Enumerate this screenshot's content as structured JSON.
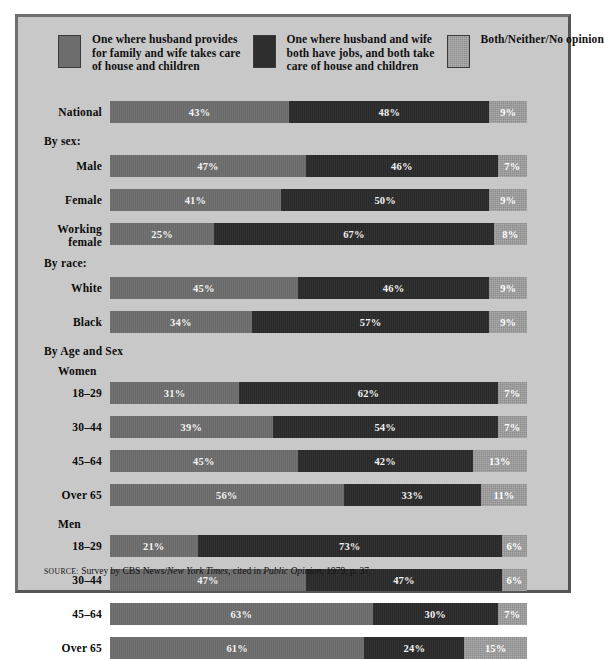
{
  "legend": [
    {
      "swatch": "swatch-dark-gray",
      "color": "#6d6d6d",
      "lines": [
        "One where husband provides",
        "for family and wife takes care",
        "of house and children"
      ]
    },
    {
      "swatch": "swatch-black",
      "color": "#2b2b2b",
      "lines": [
        "One where husband and wife",
        "both have jobs, and both take",
        "care of house and children"
      ]
    },
    {
      "swatch": "swatch-light-gray",
      "color": "#9b9b9b",
      "lines": [
        "Both/Neither/No opinion"
      ]
    }
  ],
  "source": {
    "prefix": "Source:",
    "text_1": "Survey by CBS News/",
    "italic_1": "New York Times",
    "text_2": ", cited in ",
    "italic_2": "Public Opinion",
    "text_3": ", 1979, p. 37."
  },
  "chart_data": {
    "type": "bar",
    "orientation": "horizontal",
    "stacked": true,
    "title": "",
    "xlabel": "",
    "ylabel": "",
    "xlim": [
      0,
      100
    ],
    "grid": false,
    "legend_position": "top",
    "value_unit": "%",
    "series": [
      {
        "name": "One where husband provides for family and wife takes care of house and children",
        "color": "#6d6d6d",
        "values": [
          43,
          47,
          41,
          25,
          45,
          34,
          31,
          39,
          45,
          56,
          21,
          47,
          63,
          61
        ]
      },
      {
        "name": "One where husband and wife both have jobs, and both take care of house and children",
        "color": "#2b2b2b",
        "values": [
          48,
          46,
          50,
          67,
          46,
          57,
          62,
          54,
          42,
          33,
          73,
          47,
          30,
          24
        ]
      },
      {
        "name": "Both/Neither/No opinion",
        "color": "#9b9b9b",
        "values": [
          9,
          7,
          9,
          8,
          9,
          9,
          7,
          7,
          13,
          11,
          6,
          6,
          7,
          15
        ]
      }
    ],
    "categories": [
      "National",
      "Male",
      "Female",
      "Working female",
      "White",
      "Black",
      "18-29",
      "30-44",
      "45-64",
      "Over 65",
      "18-29",
      "30-44",
      "45-64",
      "Over 65"
    ]
  },
  "blocks": [
    {
      "type": "row",
      "label_lines": [
        "National"
      ],
      "values": [
        43,
        48,
        9
      ],
      "labels": [
        "43%",
        "48%",
        "9%"
      ]
    },
    {
      "type": "group",
      "label": "By sex:"
    },
    {
      "type": "row",
      "label_lines": [
        "Male"
      ],
      "values": [
        47,
        46,
        7
      ],
      "labels": [
        "47%",
        "46%",
        "7%"
      ]
    },
    {
      "type": "row",
      "label_lines": [
        "Female"
      ],
      "values": [
        41,
        50,
        9
      ],
      "labels": [
        "41%",
        "50%",
        "9%"
      ]
    },
    {
      "type": "row",
      "label_lines": [
        "Working",
        "female"
      ],
      "values": [
        25,
        67,
        8
      ],
      "labels": [
        "25%",
        "67%",
        "8%"
      ]
    },
    {
      "type": "group",
      "label": "By race:"
    },
    {
      "type": "row",
      "label_lines": [
        "White"
      ],
      "values": [
        45,
        46,
        9
      ],
      "labels": [
        "45%",
        "46%",
        "9%"
      ]
    },
    {
      "type": "row",
      "label_lines": [
        "Black"
      ],
      "values": [
        34,
        57,
        9
      ],
      "labels": [
        "34%",
        "57%",
        "9%"
      ]
    },
    {
      "type": "group",
      "label": "By Age and Sex"
    },
    {
      "type": "subgroup",
      "label": "Women"
    },
    {
      "type": "row",
      "label_lines": [
        "18–29"
      ],
      "values": [
        31,
        62,
        7
      ],
      "labels": [
        "31%",
        "62%",
        "7%"
      ]
    },
    {
      "type": "row",
      "label_lines": [
        "30–44"
      ],
      "values": [
        39,
        54,
        7
      ],
      "labels": [
        "39%",
        "54%",
        "7%"
      ]
    },
    {
      "type": "row",
      "label_lines": [
        "45–64"
      ],
      "values": [
        45,
        42,
        13
      ],
      "labels": [
        "45%",
        "42%",
        "13%"
      ]
    },
    {
      "type": "row",
      "label_lines": [
        "Over 65"
      ],
      "values": [
        56,
        33,
        11
      ],
      "labels": [
        "56%",
        "33%",
        "11%"
      ]
    },
    {
      "type": "subgroup",
      "label": "Men"
    },
    {
      "type": "row",
      "label_lines": [
        "18–29"
      ],
      "values": [
        21,
        73,
        6
      ],
      "labels": [
        "21%",
        "73%",
        "6%"
      ]
    },
    {
      "type": "row",
      "label_lines": [
        "30–44"
      ],
      "values": [
        47,
        47,
        6
      ],
      "labels": [
        "47%",
        "47%",
        "6%"
      ]
    },
    {
      "type": "row",
      "label_lines": [
        "45–64"
      ],
      "values": [
        63,
        30,
        7
      ],
      "labels": [
        "63%",
        "30%",
        "7%"
      ]
    },
    {
      "type": "row",
      "label_lines": [
        "Over 65"
      ],
      "values": [
        61,
        24,
        15
      ],
      "labels": [
        "61%",
        "24%",
        "15%"
      ]
    }
  ]
}
